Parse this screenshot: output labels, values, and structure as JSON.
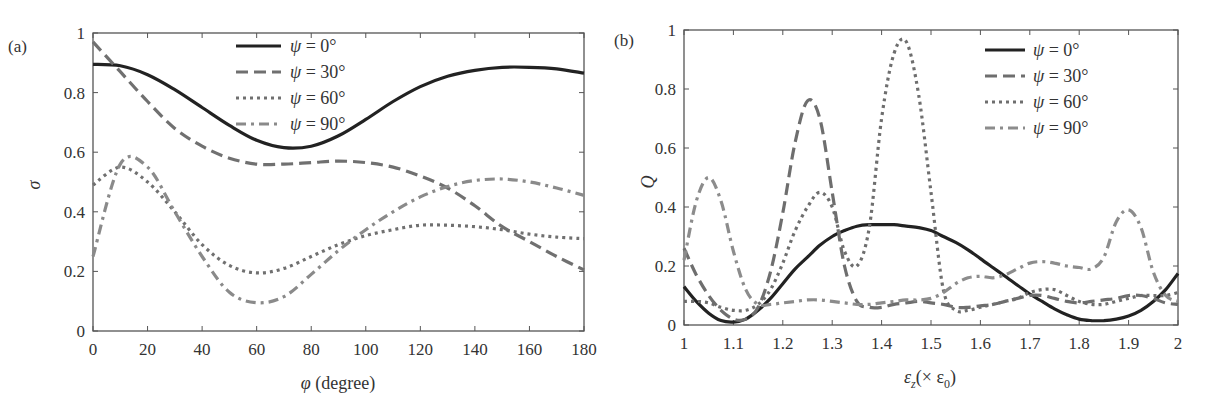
{
  "chart_data": [
    {
      "panel": "(a)",
      "type": "line",
      "title": "",
      "xlabel": "φ (degree)",
      "ylabel": "σ",
      "xlim": [
        0,
        180
      ],
      "ylim": [
        0,
        1
      ],
      "xticks": [
        0,
        20,
        40,
        60,
        80,
        100,
        120,
        140,
        160,
        180
      ],
      "yticks": [
        0,
        0.2,
        0.4,
        0.6,
        0.8,
        1
      ],
      "xtick_labels": [
        "0",
        "20",
        "40",
        "60",
        "80",
        "100",
        "120",
        "140",
        "160",
        "180"
      ],
      "ytick_labels": [
        "0",
        "0.2",
        "0.4",
        "0.6",
        "0.8",
        "1"
      ],
      "grid": false,
      "legend_position": "upper center",
      "x": [
        0,
        10,
        20,
        30,
        40,
        50,
        60,
        70,
        80,
        90,
        100,
        110,
        120,
        130,
        140,
        150,
        160,
        170,
        180
      ],
      "series": [
        {
          "name": "ψ = 0°",
          "style": "solid",
          "color": "#222222",
          "values": [
            0.895,
            0.89,
            0.86,
            0.81,
            0.75,
            0.69,
            0.64,
            0.615,
            0.62,
            0.655,
            0.71,
            0.77,
            0.82,
            0.855,
            0.875,
            0.885,
            0.885,
            0.88,
            0.865
          ]
        },
        {
          "name": "ψ = 30°",
          "style": "dashed",
          "color": "#707070",
          "values": [
            0.97,
            0.87,
            0.77,
            0.68,
            0.62,
            0.58,
            0.56,
            0.56,
            0.565,
            0.57,
            0.565,
            0.55,
            0.52,
            0.48,
            0.42,
            0.35,
            0.3,
            0.25,
            0.205
          ]
        },
        {
          "name": "ψ = 60°",
          "style": "dotted",
          "color": "#707070",
          "values": [
            0.49,
            0.55,
            0.5,
            0.4,
            0.29,
            0.22,
            0.195,
            0.21,
            0.25,
            0.29,
            0.32,
            0.34,
            0.355,
            0.355,
            0.35,
            0.34,
            0.325,
            0.315,
            0.31
          ]
        },
        {
          "name": "ψ = 90°",
          "style": "dash-dot",
          "color": "#8a8a8a",
          "values": [
            0.25,
            0.56,
            0.55,
            0.4,
            0.25,
            0.13,
            0.095,
            0.115,
            0.19,
            0.27,
            0.34,
            0.4,
            0.45,
            0.485,
            0.505,
            0.51,
            0.5,
            0.48,
            0.455
          ]
        }
      ]
    },
    {
      "panel": "(b)",
      "type": "line",
      "title": "",
      "xlabel": "εz(× ε0)",
      "ylabel": "Q",
      "xlim": [
        1,
        2
      ],
      "ylim": [
        0,
        1
      ],
      "xticks": [
        1,
        1.1,
        1.2,
        1.3,
        1.4,
        1.5,
        1.6,
        1.7,
        1.8,
        1.9,
        2
      ],
      "yticks": [
        0,
        0.2,
        0.4,
        0.6,
        0.8,
        1
      ],
      "xtick_labels": [
        "1",
        "1.1",
        "1.2",
        "1.3",
        "1.4",
        "1.5",
        "1.6",
        "1.7",
        "1.8",
        "1.9",
        "2"
      ],
      "ytick_labels": [
        "0",
        "0.2",
        "0.4",
        "0.6",
        "0.8",
        "1"
      ],
      "grid": false,
      "legend_position": "upper right",
      "x": [
        1.0,
        1.025,
        1.05,
        1.075,
        1.1,
        1.125,
        1.15,
        1.175,
        1.2,
        1.225,
        1.25,
        1.275,
        1.3,
        1.325,
        1.35,
        1.375,
        1.4,
        1.425,
        1.45,
        1.475,
        1.5,
        1.525,
        1.55,
        1.575,
        1.6,
        1.625,
        1.65,
        1.675,
        1.7,
        1.725,
        1.75,
        1.775,
        1.8,
        1.825,
        1.85,
        1.875,
        1.9,
        1.925,
        1.95,
        1.975,
        2.0
      ],
      "series": [
        {
          "name": "ψ = 0°",
          "style": "solid",
          "color": "#222222",
          "values": [
            0.13,
            0.08,
            0.04,
            0.015,
            0.01,
            0.02,
            0.05,
            0.09,
            0.14,
            0.19,
            0.23,
            0.27,
            0.3,
            0.32,
            0.335,
            0.34,
            0.34,
            0.34,
            0.335,
            0.33,
            0.32,
            0.3,
            0.28,
            0.255,
            0.225,
            0.195,
            0.165,
            0.135,
            0.105,
            0.08,
            0.055,
            0.035,
            0.02,
            0.015,
            0.015,
            0.02,
            0.03,
            0.05,
            0.08,
            0.12,
            0.175
          ]
        },
        {
          "name": "ψ = 30°",
          "style": "dashed",
          "color": "#6e6e6e",
          "values": [
            0.26,
            0.17,
            0.1,
            0.05,
            0.02,
            0.02,
            0.06,
            0.18,
            0.38,
            0.62,
            0.76,
            0.7,
            0.45,
            0.2,
            0.08,
            0.06,
            0.06,
            0.07,
            0.075,
            0.08,
            0.075,
            0.07,
            0.06,
            0.06,
            0.065,
            0.07,
            0.08,
            0.09,
            0.1,
            0.1,
            0.09,
            0.08,
            0.075,
            0.08,
            0.085,
            0.09,
            0.1,
            0.1,
            0.09,
            0.075,
            0.07
          ]
        },
        {
          "name": "ψ = 60°",
          "style": "dotted",
          "color": "#6e6e6e",
          "values": [
            0.08,
            0.08,
            0.075,
            0.06,
            0.05,
            0.05,
            0.07,
            0.12,
            0.21,
            0.32,
            0.4,
            0.45,
            0.4,
            0.25,
            0.2,
            0.33,
            0.7,
            0.92,
            0.96,
            0.78,
            0.45,
            0.12,
            0.05,
            0.05,
            0.06,
            0.07,
            0.08,
            0.09,
            0.11,
            0.12,
            0.12,
            0.1,
            0.08,
            0.07,
            0.07,
            0.08,
            0.09,
            0.1,
            0.1,
            0.1,
            0.11
          ]
        },
        {
          "name": "ψ = 90°",
          "style": "dash-dot",
          "color": "#8c8c8c",
          "values": [
            0.22,
            0.42,
            0.5,
            0.42,
            0.25,
            0.12,
            0.07,
            0.07,
            0.075,
            0.08,
            0.085,
            0.085,
            0.08,
            0.075,
            0.07,
            0.07,
            0.075,
            0.08,
            0.085,
            0.085,
            0.09,
            0.11,
            0.14,
            0.16,
            0.165,
            0.16,
            0.17,
            0.19,
            0.21,
            0.215,
            0.21,
            0.2,
            0.195,
            0.19,
            0.23,
            0.35,
            0.39,
            0.33,
            0.18,
            0.1,
            0.08
          ]
        }
      ]
    }
  ],
  "panels": {
    "a": {
      "label": "(a)",
      "xlabel_main": "φ",
      "xlabel_rest": " (degree)",
      "ylabel": "σ"
    },
    "b": {
      "label": "(b)",
      "xlabel_main": "ε",
      "xlabel_sub": "z",
      "xlabel_mid": "(× ε",
      "xlabel_sub2": "0",
      "xlabel_end": ")",
      "ylabel": "Q"
    }
  },
  "legend": {
    "items": [
      {
        "psi": "ψ",
        "text": " = 0°"
      },
      {
        "psi": "ψ",
        "text": " = 30°"
      },
      {
        "psi": "ψ",
        "text": " = 60°"
      },
      {
        "psi": "ψ",
        "text": " = 90°"
      }
    ]
  }
}
